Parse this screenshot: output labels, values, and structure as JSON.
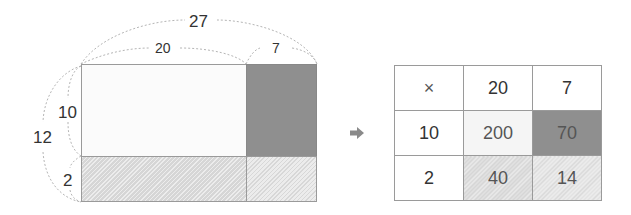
{
  "diagram": {
    "area_model": {
      "total_width_label": "27",
      "width_parts": [
        "20",
        "7"
      ],
      "total_height_label": "12",
      "height_parts": [
        "10",
        "2"
      ],
      "colors": {
        "top_left": "#fbfbfb",
        "top_right": "#8f8f8f",
        "bottom_left": "#d6d6d6",
        "bottom_right": "#ececec",
        "border": "#9a9a9a",
        "dashed_arc": "#b5b5b5"
      }
    },
    "arrow_icon": "right-arrow-icon",
    "arrow_color": "#8a8a8a",
    "table": {
      "header": [
        "×",
        "20",
        "7"
      ],
      "rows": [
        [
          "10",
          "200",
          "70"
        ],
        [
          "2",
          "40",
          "14"
        ]
      ],
      "colors": {
        "cell_200": "#f5f5f5",
        "cell_70": "#8f8f8f",
        "cell_40": "#d6d6d6",
        "cell_14": "#ececec"
      }
    }
  }
}
